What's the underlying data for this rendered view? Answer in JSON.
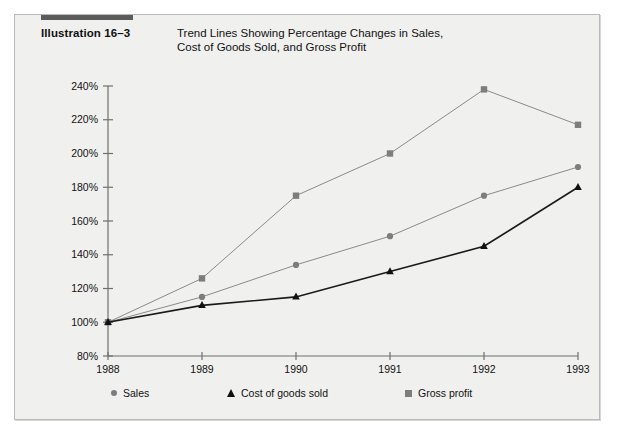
{
  "figure": {
    "illustration_label": "Illustration 16–3",
    "title": "Trend Lines Showing Percentage Changes in Sales,\nCost of Goods Sold, and Gross Profit",
    "accent_color": "#5b5b5b",
    "background_color": "#f0f0ef",
    "border_color": "#b9b9b7"
  },
  "chart_data": {
    "type": "line",
    "title": "Trend Lines Showing Percentage Changes in Sales, Cost of Goods Sold, and Gross Profit",
    "xlabel": "",
    "ylabel": "",
    "categories": [
      "1988",
      "1989",
      "1990",
      "1991",
      "1992",
      "1993"
    ],
    "x": [
      1988,
      1989,
      1990,
      1991,
      1992,
      1993
    ],
    "ylim": [
      80,
      240
    ],
    "yticks": [
      80,
      100,
      120,
      140,
      160,
      180,
      200,
      220,
      240
    ],
    "ytick_labels": [
      "80%",
      "100%",
      "120%",
      "140%",
      "160%",
      "180%",
      "200%",
      "220%",
      "240%"
    ],
    "xtick_labels": [
      "1988",
      "1989",
      "1990",
      "1991",
      "1992",
      "1993"
    ],
    "grid": false,
    "legend_position": "bottom",
    "series": [
      {
        "name": "Sales",
        "marker": "circle",
        "color": "#7d7d7d",
        "line_color": "#8a8a8a",
        "values": [
          100,
          115,
          134,
          151,
          175,
          192
        ]
      },
      {
        "name": "Cost of goods sold",
        "marker": "triangle",
        "color": "#111111",
        "line_color": "#1a1a1a",
        "values": [
          100,
          110,
          115,
          130,
          145,
          180
        ]
      },
      {
        "name": "Gross profit",
        "marker": "square",
        "color": "#7d7d7d",
        "line_color": "#8a8a8a",
        "values": [
          100,
          126,
          175,
          200,
          238,
          217
        ]
      }
    ]
  },
  "legend": {
    "items": [
      {
        "label": "Sales",
        "marker": "circle-marker"
      },
      {
        "label": "Cost of goods sold",
        "marker": "triangle-marker"
      },
      {
        "label": "Gross profit",
        "marker": "square-marker"
      }
    ]
  }
}
